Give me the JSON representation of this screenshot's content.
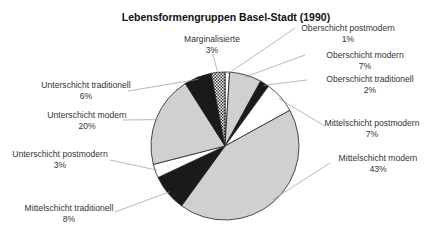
{
  "chart_data": {
    "type": "pie",
    "title": "Lebensformengruppen Basel-Stadt (1990)",
    "start_angle_deg": 0,
    "direction": "clockwise",
    "slices": [
      {
        "label": "Oberschicht postmodern",
        "value": 1,
        "value_label": "1%",
        "fill": "#ffffff",
        "pattern": "solid"
      },
      {
        "label": "Oberschicht modern",
        "value": 7,
        "value_label": "7%",
        "fill": "#d0d0d0",
        "pattern": "solid"
      },
      {
        "label": "Oberschicht traditionell",
        "value": 2,
        "value_label": "2%",
        "fill": "#1a1a1a",
        "pattern": "solid"
      },
      {
        "label": "Mittelschicht postmodern",
        "value": 7,
        "value_label": "7%",
        "fill": "#ffffff",
        "pattern": "solid"
      },
      {
        "label": "Mittelschicht modern",
        "value": 43,
        "value_label": "43%",
        "fill": "#d0d0d0",
        "pattern": "solid"
      },
      {
        "label": "Mittelschicht traditionell",
        "value": 8,
        "value_label": "8%",
        "fill": "#1a1a1a",
        "pattern": "solid"
      },
      {
        "label": "Unterschicht postmodern",
        "value": 3,
        "value_label": "3%",
        "fill": "#ffffff",
        "pattern": "solid"
      },
      {
        "label": "Unterschicht modern",
        "value": 20,
        "value_label": "20%",
        "fill": "#d0d0d0",
        "pattern": "solid"
      },
      {
        "label": "Unterschicht traditionell",
        "value": 6,
        "value_label": "6%",
        "fill": "#1a1a1a",
        "pattern": "solid"
      },
      {
        "label": "Marginalisierte",
        "value": 3,
        "value_label": "3%",
        "fill": "#ffffff",
        "pattern": "checkered"
      }
    ],
    "labels_layout": [
      {
        "x": 348,
        "y": 31,
        "anchor": "middle",
        "lx": 295,
        "ly": 28
      },
      {
        "x": 365,
        "y": 58,
        "anchor": "middle",
        "lx": 305,
        "ly": 55
      },
      {
        "x": 370,
        "y": 82,
        "anchor": "middle",
        "lx": 307,
        "ly": 80
      },
      {
        "x": 372,
        "y": 126,
        "anchor": "middle",
        "lx": 325,
        "ly": 126
      },
      {
        "x": 378,
        "y": 161,
        "anchor": "middle",
        "lx": 330,
        "ly": 163
      },
      {
        "x": 69,
        "y": 211,
        "anchor": "middle",
        "lx": 115,
        "ly": 212
      },
      {
        "x": 60,
        "y": 157,
        "anchor": "middle",
        "lx": 110,
        "ly": 160
      },
      {
        "x": 87,
        "y": 118,
        "anchor": "middle",
        "lx": 123,
        "ly": 120
      },
      {
        "x": 86,
        "y": 88,
        "anchor": "middle",
        "lx": 128,
        "ly": 91
      },
      {
        "x": 212,
        "y": 42,
        "anchor": "middle",
        "lx": 212,
        "ly": 51
      }
    ],
    "pie": {
      "cx": 225,
      "cy": 146,
      "r": 74
    }
  }
}
